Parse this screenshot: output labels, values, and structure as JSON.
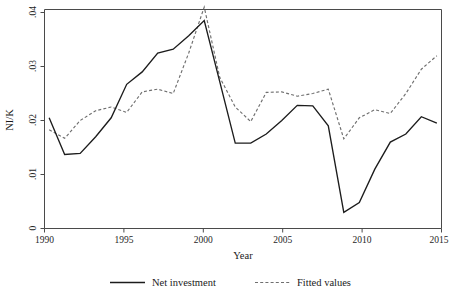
{
  "chart_data": {
    "type": "line",
    "title": "",
    "xlabel": "Year",
    "ylabel": "NI/K",
    "x": [
      1990,
      1991,
      1992,
      1993,
      1994,
      1995,
      1996,
      1997,
      1998,
      1999,
      2000,
      2001,
      2002,
      2003,
      2004,
      2005,
      2006,
      2007,
      2008,
      2009,
      2010,
      2011,
      2012,
      2013,
      2014,
      2015
    ],
    "xlim": [
      1989.7,
      2015.3
    ],
    "ylim": [
      0,
      0.0425
    ],
    "xticks": [
      1990,
      1995,
      2000,
      2005,
      2010,
      2015
    ],
    "xtick_labels": [
      "1990",
      "1995",
      "2000",
      "2005",
      "2010",
      "2015"
    ],
    "yticks": [
      0,
      0.01,
      0.02,
      0.03,
      0.04
    ],
    "ytick_labels": [
      "0",
      ".01",
      ".02",
      ".03",
      ".04"
    ],
    "grid": false,
    "legend_position": "bottom-outside",
    "series": [
      {
        "name": "Net investment",
        "style": "solid",
        "color": "#1c1c1c",
        "values": [
          0.0205,
          0.0137,
          0.0139,
          0.017,
          0.0205,
          0.0267,
          0.029,
          0.0325,
          0.0332,
          0.0357,
          0.0385,
          0.0272,
          0.0158,
          0.0158,
          0.0175,
          0.02,
          0.0228,
          0.0227,
          0.019,
          0.003,
          0.0048,
          0.011,
          0.016,
          0.0175,
          0.0207,
          0.0195
        ]
      },
      {
        "name": "Fitted values",
        "style": "dashed",
        "color": "#6f6f6f",
        "values": [
          0.0183,
          0.0167,
          0.02,
          0.0218,
          0.0225,
          0.0215,
          0.0253,
          0.0258,
          0.025,
          0.0325,
          0.041,
          0.028,
          0.0225,
          0.0198,
          0.0252,
          0.0253,
          0.0245,
          0.025,
          0.0258,
          0.0166,
          0.0205,
          0.022,
          0.0213,
          0.025,
          0.0295,
          0.032
        ]
      }
    ]
  },
  "axes": {
    "y_title": "NI/K",
    "x_title": "Year",
    "y_tick_labels": [
      "0",
      ".01",
      ".02",
      ".03",
      ".04"
    ],
    "x_tick_labels": [
      "1990",
      "1995",
      "2000",
      "2005",
      "2010",
      "2015"
    ]
  },
  "legend": {
    "entries": [
      {
        "label": "Net investment",
        "style": "solid"
      },
      {
        "label": "Fitted values",
        "style": "dashed"
      }
    ]
  },
  "colors": {
    "solid_series": "#1c1c1c",
    "dashed_series": "#6f6f6f",
    "axis": "#4a4a4a",
    "background": "#ffffff"
  }
}
